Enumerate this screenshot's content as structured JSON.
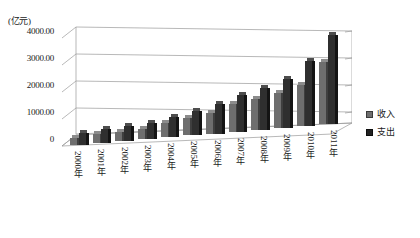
{
  "chart_data": {
    "type": "bar",
    "title": "",
    "subtitle": "",
    "xlabel": "",
    "ylabel": "(亿元)",
    "unit_label": "(亿元)",
    "grid": true,
    "three_d": true,
    "legend_position": "right",
    "ylim": [
      0,
      4000
    ],
    "ytick_labels": [
      "4000.00",
      "3000.00",
      "2000.00",
      "1000.00",
      "0"
    ],
    "ytick_values": [
      4000,
      3000,
      2000,
      1000,
      0
    ],
    "categories": [
      "2000年",
      "2001年",
      "2002年",
      "2003年",
      "2004年",
      "2005年",
      "2006年",
      "2007年",
      "2008年",
      "2009年",
      "2010年",
      "2011年"
    ],
    "series": [
      {
        "name": "收入",
        "color": "#6e6e6e",
        "values": [
          250,
          330,
          360,
          400,
          520,
          650,
          780,
          1020,
          1150,
          1280,
          1500,
          2300
        ]
      },
      {
        "name": "支出",
        "color": "#2f2f2f",
        "values": [
          430,
          520,
          560,
          620,
          760,
          900,
          1080,
          1350,
          1550,
          1800,
          2400,
          3300
        ]
      }
    ]
  },
  "legend": {
    "items": [
      {
        "label": "收入",
        "swatch": "income-swatch"
      },
      {
        "label": "支出",
        "swatch": "expenditure-swatch"
      }
    ]
  },
  "axis": {
    "unit": "(亿元)",
    "y_ticks": [
      "4000.00",
      "3000.00",
      "2000.00",
      "1000.00",
      "0"
    ],
    "x_ticks": [
      "2000年",
      "2001年",
      "2002年",
      "2003年",
      "2004年",
      "2005年",
      "2006年",
      "2007年",
      "2008年",
      "2009年",
      "2010年",
      "2011年"
    ]
  }
}
